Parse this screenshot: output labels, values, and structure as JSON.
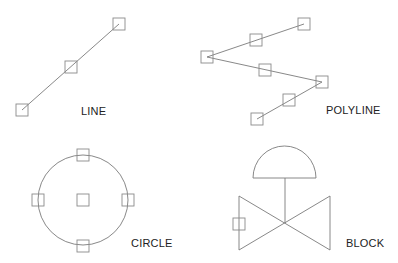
{
  "diagram": {
    "colors": {
      "geometry": "#7a7a7a",
      "grip": "#8a8a8a",
      "label": "#222222",
      "background": "#ffffff"
    },
    "grip_size": 12,
    "objects": [
      {
        "id": "line",
        "label": "LINE",
        "label_pos": [
          81,
          115
        ],
        "type": "line",
        "points": [
          [
            22,
            110
          ],
          [
            119,
            24
          ]
        ],
        "grips": [
          [
            22,
            110
          ],
          [
            71,
            67
          ],
          [
            119,
            24
          ]
        ]
      },
      {
        "id": "polyline",
        "label": "POLYLINE",
        "label_pos": [
          326,
          114
        ],
        "type": "polyline",
        "points": [
          [
            304,
            24
          ],
          [
            207,
            57
          ],
          [
            322,
            82
          ],
          [
            257,
            119
          ]
        ],
        "grips": [
          [
            304,
            24
          ],
          [
            256,
            40
          ],
          [
            207,
            57
          ],
          [
            265,
            70
          ],
          [
            322,
            82
          ],
          [
            289,
            100
          ],
          [
            257,
            119
          ]
        ]
      },
      {
        "id": "circle",
        "label": "CIRCLE",
        "label_pos": [
          131,
          247
        ],
        "type": "circle",
        "center": [
          83,
          200
        ],
        "radius": 45,
        "grips": [
          [
            83,
            155
          ],
          [
            38,
            200
          ],
          [
            83,
            200
          ],
          [
            128,
            200
          ],
          [
            83,
            246
          ]
        ]
      },
      {
        "id": "block",
        "label": "BLOCK",
        "label_pos": [
          346,
          247
        ],
        "type": "block",
        "description": "valve symbol with dome actuator",
        "grips": [
          [
            239,
            224
          ]
        ]
      }
    ]
  }
}
